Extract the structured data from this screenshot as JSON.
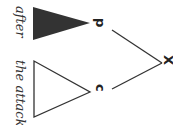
{
  "diagram": {
    "type": "syntax-tree",
    "orientation": "rotated-90-clockwise",
    "root": {
      "label": "X"
    },
    "children": [
      {
        "label": "p",
        "subtree": "filled-triangle",
        "text": "after"
      },
      {
        "label": "c",
        "subtree": "outline-triangle",
        "text": "the attack"
      }
    ],
    "colors": {
      "line": "#333333",
      "filled": "#333333",
      "background": "#ffffff"
    }
  }
}
